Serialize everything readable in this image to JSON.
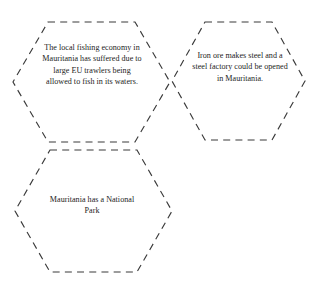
{
  "canvas": {
    "width": 319,
    "height": 288,
    "background_color": "#ffffff"
  },
  "style": {
    "outline_color": "#3a3a3a",
    "text_color": "#1c1c1c",
    "dash_pattern": "7 5.2"
  },
  "diagram": {
    "shape": "hexagon",
    "outline_style": "dashed",
    "count": 3,
    "nodes": [
      {
        "id": "hex-fishing-economy",
        "name": "fishing-economy-hexagon",
        "text": "The local fishing economy in Mauritania has suffered due to large EU trawlers being allowed to fish in its waters.",
        "points": "48,22 135,22 170,82 135,142 48,142 13,82"
      },
      {
        "id": "hex-iron-ore-steel",
        "name": "iron-ore-steel-hexagon",
        "text": "Iron ore makes steel and a steel factory could be opened in Mauritania.",
        "points": "205,22 272,22 305,81 272,140 205,140 172,81"
      },
      {
        "id": "hex-national-park",
        "name": "national-park-hexagon",
        "text": "Mauritania has a National Park",
        "points": "50,150 137,150 172,211 137,272 50,272 15,211"
      }
    ]
  }
}
